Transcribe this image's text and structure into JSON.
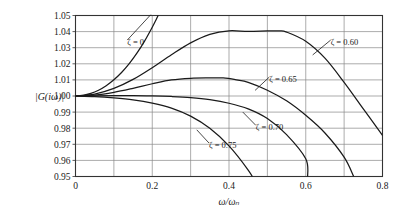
{
  "chart_data": {
    "type": "line",
    "title": "",
    "subtitle": "",
    "xlabel": "ω/ωₙ",
    "ylabel": "|G(iω)|",
    "xlim": [
      0,
      0.8
    ],
    "ylim": [
      0.95,
      1.05
    ],
    "xticks": [
      0,
      0.2,
      0.4,
      0.6,
      0.8
    ],
    "xtick_labels": [
      "0",
      "0.2",
      "0.4",
      "0.6",
      "0.8"
    ],
    "x_minor_step": 0.1,
    "yticks": [
      0.95,
      0.96,
      0.97,
      0.98,
      0.99,
      1.0,
      1.01,
      1.02,
      1.03,
      1.04,
      1.05
    ],
    "ytick_labels": [
      "0.95",
      "0.96",
      "0.97",
      "0.98",
      "0.99",
      "1.00",
      "1.01",
      "1.02",
      "1.03",
      "1.04",
      "1.05"
    ],
    "grid": true,
    "grid_color": "#888888",
    "axis_color": "#333333",
    "curve_color": "#1a1a1a",
    "background": "#ffffff",
    "legend_position": "inline-annotations",
    "series": [
      {
        "name": "ζ = 0",
        "zeta": 0,
        "label": "ζ = 0",
        "label_x": 0.135,
        "label_y": 1.0335,
        "leader_to_x": 0.196,
        "leader_to_y": 1.0505,
        "x": [
          0.0,
          0.02,
          0.04,
          0.06,
          0.08,
          0.1,
          0.12,
          0.14,
          0.16,
          0.18,
          0.2,
          0.21,
          0.22
        ],
        "y": [
          1.0,
          1.0004,
          1.0016,
          1.0036,
          1.0064,
          1.0101,
          1.0146,
          1.0201,
          1.0266,
          1.0341,
          1.0427,
          1.0474,
          1.0524
        ]
      },
      {
        "name": "ζ = 0.60",
        "zeta": 0.6,
        "label": "ζ = 0.60",
        "label_x": 0.665,
        "label_y": 1.0335,
        "leader_to_x": 0.618,
        "leader_to_y": 1.0255,
        "peak_x": 0.53,
        "peak_y": 1.0404,
        "x": [
          0.0,
          0.05,
          0.1,
          0.15,
          0.2,
          0.25,
          0.3,
          0.35,
          0.4,
          0.45,
          0.5,
          0.53,
          0.55,
          0.6,
          0.65,
          0.7,
          0.75,
          0.8
        ],
        "y": [
          1.0,
          1.0012,
          1.0047,
          1.0103,
          1.0176,
          1.0256,
          1.033,
          1.0383,
          1.0405,
          1.0401,
          1.0404,
          1.0404,
          1.0397,
          1.034,
          1.0235,
          1.0085,
          0.992,
          0.9755
        ]
      },
      {
        "name": "ζ = 0.65",
        "zeta": 0.65,
        "label": "ζ = 0.65",
        "label_x": 0.505,
        "label_y": 1.0105,
        "leader_to_x": 0.468,
        "leader_to_y": 1.0035,
        "peak_x": 0.385,
        "peak_y": 1.0112,
        "x": [
          0.0,
          0.05,
          0.1,
          0.15,
          0.2,
          0.25,
          0.3,
          0.35,
          0.385,
          0.42,
          0.45,
          0.5,
          0.55,
          0.6,
          0.65,
          0.7,
          0.725
        ],
        "y": [
          1.0,
          1.0006,
          1.0023,
          1.0048,
          1.0076,
          1.01,
          1.011,
          1.0112,
          1.0112,
          1.01,
          1.0085,
          1.0036,
          0.997,
          0.988,
          0.977,
          0.962,
          0.95
        ]
      },
      {
        "name": "ζ = 0.70",
        "zeta": 0.7,
        "label": "ζ = 0.70",
        "label_x": 0.47,
        "label_y": 0.9805,
        "leader_to_x": 0.436,
        "leader_to_y": 0.99,
        "x": [
          0.0,
          0.05,
          0.1,
          0.15,
          0.2,
          0.25,
          0.3,
          0.35,
          0.4,
          0.45,
          0.5,
          0.55,
          0.6,
          0.605
        ],
        "y": [
          1.0,
          1.0001,
          1.0002,
          1.0003,
          1.0001,
          0.9997,
          0.999,
          0.9977,
          0.9955,
          0.992,
          0.986,
          0.976,
          0.961,
          0.95
        ]
      },
      {
        "name": "ζ = 0.75",
        "zeta": 0.75,
        "label": "ζ = 0.75",
        "label_x": 0.348,
        "label_y": 0.9695,
        "leader_to_x": 0.316,
        "leader_to_y": 0.979,
        "x": [
          0.0,
          0.05,
          0.1,
          0.15,
          0.2,
          0.25,
          0.3,
          0.35,
          0.4,
          0.45,
          0.47
        ],
        "y": [
          1.0,
          0.9996,
          0.9988,
          0.9976,
          0.9956,
          0.9925,
          0.9875,
          0.98,
          0.969,
          0.954,
          0.946
        ]
      }
    ]
  }
}
